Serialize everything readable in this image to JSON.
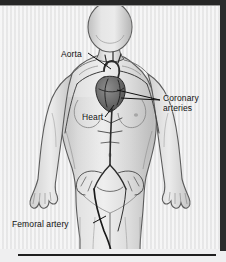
{
  "illustration": {
    "title": "Cardiovascular anatomy diagram",
    "subject": "female-body-anterior-view",
    "style": "grayscale-medical-illustration",
    "colors": {
      "background": "#ececed",
      "frame": "#262626",
      "body_outline": "#555555",
      "body_fill": "#d8d8d8",
      "artery_line": "#2a2a2a",
      "label_text": "#111111"
    },
    "labels": [
      {
        "id": "aorta",
        "text": "Aorta",
        "points_to": "aorta-arch",
        "leader": "down-right"
      },
      {
        "id": "coronary-arteries",
        "text": "Coronary arteries",
        "line1": "Coronary",
        "line2": "arteries",
        "points_to": "heart-surface-vessels",
        "leader": "left"
      },
      {
        "id": "heart",
        "text": "Heart",
        "points_to": "heart",
        "leader": "up-right"
      },
      {
        "id": "femoral-artery",
        "text": "Femoral artery",
        "points_to": "femoral-artery-line",
        "leader": "up-right"
      }
    ],
    "structures": [
      "head",
      "neck",
      "torso",
      "left-arm",
      "right-arm",
      "breasts",
      "pelvis",
      "legs",
      "aorta",
      "heart",
      "coronary-arteries",
      "iliac-arteries",
      "femoral-artery"
    ]
  }
}
